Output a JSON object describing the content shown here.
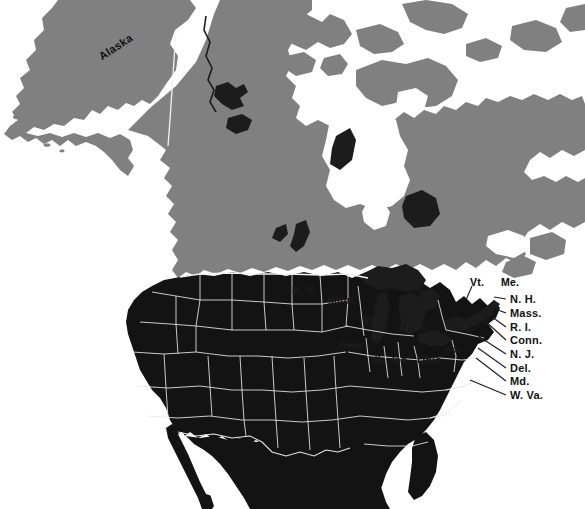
{
  "figure": {
    "kind": "thematic-map",
    "width": 585,
    "height": 509
  },
  "colors": {
    "background": "#ffffff",
    "water": "#ffffff",
    "canada_fill": "#808080",
    "united_states_fill": "#131313",
    "mexico_fill": "#131313",
    "lakes_fill": "#1c1c1c",
    "state_border": "#e8e8e8",
    "country_border_on_gray": "#f2f2f2",
    "label_text": "#141414",
    "leader_line": "#1a1a1a"
  },
  "map_labels": {
    "region_labels": [
      {
        "id": "alaska",
        "text": "Alaska",
        "x": 100,
        "y": 52,
        "style": "rot-alaska"
      },
      {
        "id": "north-dakota",
        "text": "N. D.",
        "x": 292,
        "y": 285,
        "style": ""
      },
      {
        "id": "minnesota",
        "text": "Minn.",
        "x": 328,
        "y": 295,
        "style": ""
      },
      {
        "id": "wisconsin",
        "text": "Wis.",
        "x": 362,
        "y": 315,
        "style": ""
      },
      {
        "id": "michigan",
        "text": "Mich.",
        "x": 398,
        "y": 324,
        "style": "rot-mich"
      },
      {
        "id": "iowa",
        "text": "Iowa",
        "x": 339,
        "y": 340,
        "style": ""
      },
      {
        "id": "illinois",
        "text": "Ill.",
        "x": 372,
        "y": 355,
        "style": ""
      },
      {
        "id": "indiana",
        "text": "Ind.",
        "x": 392,
        "y": 355,
        "style": ""
      },
      {
        "id": "ohio",
        "text": "Ohio",
        "x": 417,
        "y": 355,
        "style": ""
      },
      {
        "id": "pennsylvania",
        "text": "Pa.",
        "x": 446,
        "y": 347,
        "style": "rot-pa"
      },
      {
        "id": "new-york",
        "text": "N. Y.",
        "x": 452,
        "y": 322,
        "style": ""
      },
      {
        "id": "vermont",
        "text": "Vt.",
        "x": 470,
        "y": 277,
        "style": ""
      },
      {
        "id": "maine",
        "text": "Me.",
        "x": 501,
        "y": 277,
        "style": ""
      }
    ],
    "callout_labels": [
      {
        "id": "new-hampshire",
        "text": "N. H.",
        "x": 510,
        "y": 302
      },
      {
        "id": "massachusetts",
        "text": "Mass.",
        "x": 510,
        "y": 316
      },
      {
        "id": "rhode-island",
        "text": "R. I.",
        "x": 510,
        "y": 330
      },
      {
        "id": "connecticut",
        "text": "Conn.",
        "x": 510,
        "y": 343
      },
      {
        "id": "new-jersey",
        "text": "N. J.",
        "x": 510,
        "y": 357
      },
      {
        "id": "delaware",
        "text": "Del.",
        "x": 510,
        "y": 371
      },
      {
        "id": "maryland",
        "text": "Md.",
        "x": 510,
        "y": 384
      },
      {
        "id": "west-virginia",
        "text": "W. Va.",
        "x": 510,
        "y": 398
      }
    ]
  }
}
